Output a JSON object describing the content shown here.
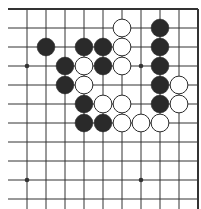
{
  "board": {
    "description": "Go board fragment (top-right area), 10 columns x 11 rows visible",
    "line_color": "#333333",
    "black_color": "#2a2a2a",
    "white_color": "#ffffff",
    "cols_x": [
      27,
      46,
      65,
      84,
      103,
      122,
      141,
      160,
      179,
      198
    ],
    "rows_y": [
      9,
      28,
      47,
      66,
      85,
      104,
      123,
      142,
      161,
      180,
      199
    ],
    "left_extent": 8,
    "bottom_extent": 209,
    "top_edge": true,
    "right_edge": true,
    "star_points": [
      [
        0,
        3
      ],
      [
        6,
        3
      ],
      [
        0,
        9
      ],
      [
        6,
        9
      ]
    ],
    "stones": [
      {
        "c": 5,
        "r": 1,
        "color": "white"
      },
      {
        "c": 7,
        "r": 1,
        "color": "black"
      },
      {
        "c": 1,
        "r": 2,
        "color": "black"
      },
      {
        "c": 3,
        "r": 2,
        "color": "black"
      },
      {
        "c": 4,
        "r": 2,
        "color": "black"
      },
      {
        "c": 5,
        "r": 2,
        "color": "white"
      },
      {
        "c": 7,
        "r": 2,
        "color": "black"
      },
      {
        "c": 2,
        "r": 3,
        "color": "black"
      },
      {
        "c": 3,
        "r": 3,
        "color": "white"
      },
      {
        "c": 4,
        "r": 3,
        "color": "black"
      },
      {
        "c": 5,
        "r": 3,
        "color": "white"
      },
      {
        "c": 7,
        "r": 3,
        "color": "black"
      },
      {
        "c": 2,
        "r": 4,
        "color": "black"
      },
      {
        "c": 3,
        "r": 4,
        "color": "white"
      },
      {
        "c": 7,
        "r": 4,
        "color": "black"
      },
      {
        "c": 8,
        "r": 4,
        "color": "white"
      },
      {
        "c": 3,
        "r": 5,
        "color": "black"
      },
      {
        "c": 4,
        "r": 5,
        "color": "white"
      },
      {
        "c": 5,
        "r": 5,
        "color": "white"
      },
      {
        "c": 7,
        "r": 5,
        "color": "black"
      },
      {
        "c": 8,
        "r": 5,
        "color": "white"
      },
      {
        "c": 3,
        "r": 6,
        "color": "black"
      },
      {
        "c": 4,
        "r": 6,
        "color": "black"
      },
      {
        "c": 5,
        "r": 6,
        "color": "white"
      },
      {
        "c": 6,
        "r": 6,
        "color": "white"
      },
      {
        "c": 7,
        "r": 6,
        "color": "white"
      }
    ]
  }
}
